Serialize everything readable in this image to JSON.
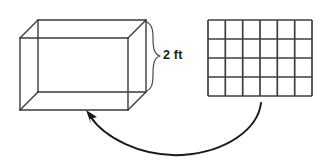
{
  "figure": {
    "background_color": "#ffffff",
    "line_color": "#3a3a3a",
    "width": 331,
    "height": 165
  },
  "prism": {
    "name": "rectangular-prism",
    "shape": "wireframe-box",
    "front_face": {
      "x": 20,
      "y": 38,
      "width": 108,
      "height": 72
    },
    "depth_offset": {
      "dx": 18,
      "dy": -18
    }
  },
  "dimension": {
    "brace_label": "2 ft",
    "value": 2,
    "unit": "ft",
    "measures": "height"
  },
  "grid": {
    "name": "unit-square-grid",
    "columns": 6,
    "rows": 4,
    "total_squares": 24,
    "x": 208,
    "y": 20,
    "width": 104,
    "height": 76,
    "line_color": "#3f3f3f",
    "fill_color": "#ffffff"
  },
  "arrow": {
    "name": "grid-to-prism-arrow",
    "style": "curved",
    "direction": "from-grid-to-prism",
    "color": "#1a1a1a",
    "start": {
      "x": 262,
      "y": 104
    },
    "end": {
      "x": 88,
      "y": 112
    }
  }
}
